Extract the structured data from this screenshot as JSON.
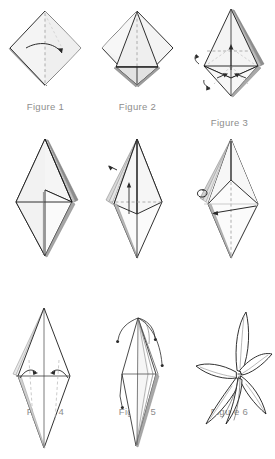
{
  "document": {
    "kind": "origami-instruction-diagram",
    "subject": "origami lily folding sequence",
    "background_color": "#ffffff",
    "caption_color": "#8d8d8d",
    "line_color": "#1a1a1a",
    "paper_fill": "#f2f2f2",
    "shadow_fill": "#c9c9c9",
    "crease_color": "#9a9a9a"
  },
  "grid": {
    "columns": 3,
    "rows": 3
  },
  "figures": [
    {
      "id": "figure-1",
      "caption": "Figure 1",
      "has_caption": true,
      "row": 0,
      "column": 0,
      "description": "square folded to a diamond with vertical dashed crease and curved fold arrow"
    },
    {
      "id": "figure-2",
      "caption": "Figure 2",
      "has_caption": true,
      "row": 0,
      "column": 1,
      "description": "diamond with inner triangular flap and horizontal fold line"
    },
    {
      "id": "figure-3",
      "caption": "Figure 3",
      "has_caption": true,
      "row": 0,
      "column": 2,
      "description": "tall kite base with crossed creases and several petal-fold arrows"
    },
    {
      "id": "figure-4",
      "caption": "Figure 4",
      "has_caption": true,
      "row": 1,
      "column": 0,
      "description": "elongated diamond bud with layered right edge"
    },
    {
      "id": "figure-5",
      "caption": "Figure 5",
      "has_caption": true,
      "row": 1,
      "column": 1,
      "description": "narrow bud with stacked left layers, horizontal crease and upward arrow"
    },
    {
      "id": "figure-6",
      "caption": "Figure 6",
      "has_caption": true,
      "row": 1,
      "column": 2,
      "description": "bud with looped turn-over arrow at left and leftward fold arrow"
    },
    {
      "id": "figure-7",
      "caption": "",
      "has_caption": false,
      "row": 2,
      "column": 0,
      "description": "slim diamond with two inward curved arrows and dashed creases"
    },
    {
      "id": "figure-8",
      "caption": "",
      "has_caption": false,
      "row": 2,
      "column": 1,
      "description": "petals being curled outward with dotted curling arrows"
    },
    {
      "id": "figure-9",
      "caption": "",
      "has_caption": false,
      "row": 2,
      "column": 2,
      "description": "finished origami lily with open curved petals"
    }
  ]
}
